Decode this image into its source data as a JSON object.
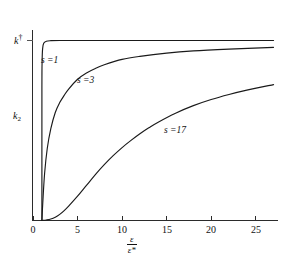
{
  "chart_data": {
    "type": "line",
    "title": "",
    "xlabel": "ε/ε*",
    "xlabel_numerator": "ε",
    "xlabel_denominator": "ε*",
    "ylabel": "k₂",
    "ylabel_symbol": "k",
    "ylabel_subscript": "2",
    "y_reference_label": "k†",
    "y_reference_symbol": "k",
    "y_reference_superscript": "†",
    "xlim": [
      0,
      27.5
    ],
    "ylim": [
      0,
      1.08
    ],
    "grid": false,
    "legend": "inline-annotations",
    "xticks": [
      0,
      5,
      10,
      15,
      20,
      25
    ],
    "xtick_labels": [
      "0",
      "5",
      "10",
      "15",
      "20",
      "25"
    ],
    "yticks": [
      1.0
    ],
    "ytick_labels": [
      "k†"
    ],
    "series": [
      {
        "name": "s = 1",
        "label": "s =1",
        "s_value": 1,
        "annotation_x": 1.6,
        "annotation_y": 0.84,
        "x": [
          1.0,
          1.0,
          1.02,
          1.08,
          1.2,
          1.5,
          2.0,
          3.0,
          5.0,
          8.0,
          12.0,
          17.0,
          22.0,
          27.0
        ],
        "y": [
          0.0,
          0.72,
          0.88,
          0.955,
          0.985,
          0.996,
          0.999,
          1.0,
          1.0,
          1.0,
          1.0,
          1.0,
          1.0,
          1.0
        ]
      },
      {
        "name": "s = 3",
        "label": "s =3",
        "s_value": 3,
        "annotation_x": 5.2,
        "annotation_y": 0.7,
        "x": [
          1.0,
          1.1,
          1.3,
          1.6,
          2.0,
          2.5,
          3.0,
          3.5,
          4.0,
          5.0,
          6.0,
          7.0,
          8.0,
          10.0,
          12.0,
          15.0,
          18.0,
          22.0,
          27.0
        ],
        "y": [
          0.0,
          0.1,
          0.26,
          0.4,
          0.51,
          0.6,
          0.655,
          0.695,
          0.73,
          0.785,
          0.82,
          0.845,
          0.865,
          0.895,
          0.912,
          0.93,
          0.942,
          0.952,
          0.962
        ]
      },
      {
        "name": "s = 17",
        "label": "s =17",
        "s_value": 17,
        "annotation_x": 15.0,
        "annotation_y": 0.5,
        "x": [
          1.0,
          1.5,
          2.0,
          2.5,
          3.0,
          3.5,
          4.0,
          5.0,
          6.0,
          7.0,
          8.0,
          9.0,
          10.0,
          11.0,
          12.0,
          13.0,
          14.0,
          16.0,
          18.0,
          20.0,
          22.0,
          24.0,
          27.0
        ],
        "y": [
          0.0,
          0.003,
          0.008,
          0.018,
          0.034,
          0.055,
          0.08,
          0.135,
          0.195,
          0.255,
          0.31,
          0.36,
          0.405,
          0.445,
          0.482,
          0.515,
          0.545,
          0.596,
          0.638,
          0.672,
          0.7,
          0.724,
          0.755
        ]
      }
    ]
  },
  "colors": {
    "curve": "#1a1a1a",
    "axis": "#2b2b2b",
    "background": "#ffffff",
    "text": "#111111"
  }
}
